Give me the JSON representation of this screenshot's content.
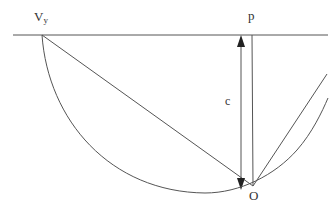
{
  "diagram": {
    "type": "geometric construction",
    "colors": {
      "stroke": "#555555",
      "text": "#333333",
      "background": "#ffffff"
    },
    "labels": {
      "vy_main": "V",
      "vy_sub": "y",
      "p": "p",
      "c": "c",
      "o": "O"
    },
    "elements": [
      {
        "name": "horizontal-line",
        "from": [
          13,
          35
        ],
        "to": [
          328,
          35
        ]
      },
      {
        "name": "chord-vy-to-o",
        "from": [
          42,
          35
        ],
        "to": [
          253,
          186
        ]
      },
      {
        "name": "vertical-line-p",
        "from": [
          252,
          35
        ],
        "to": [
          253,
          186
        ]
      },
      {
        "name": "double-arrow-c",
        "from": [
          241,
          35
        ],
        "to": [
          241,
          190
        ]
      },
      {
        "name": "arc",
        "from": [
          42,
          35
        ],
        "through": [
          200,
          192
        ],
        "to": [
          328,
          98
        ]
      },
      {
        "name": "ray-from-o",
        "from": [
          253,
          186
        ],
        "to": [
          327,
          74
        ]
      }
    ]
  }
}
